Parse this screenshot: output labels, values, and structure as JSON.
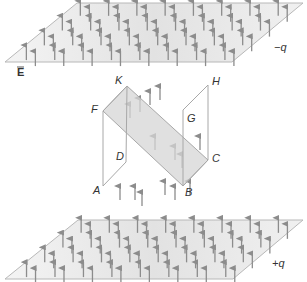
{
  "diagram": {
    "title": "",
    "colors": {
      "plate_fill": "#e8e8e8",
      "plate_edge": "#b8b8b8",
      "arrow": "#8c8c8c",
      "box_edge": "#a8a8a8",
      "diagonal_fill": "#d6d6d6",
      "label": "#333333"
    },
    "field_label": "E",
    "top_plate": {
      "charge_label": "−q",
      "corners": [
        [
          77,
          3
        ],
        [
          303,
          3
        ],
        [
          232,
          62
        ],
        [
          5,
          62
        ]
      ]
    },
    "bottom_plate": {
      "charge_label": "+q",
      "corners": [
        [
          78,
          220
        ],
        [
          303,
          220
        ],
        [
          233,
          279
        ],
        [
          5,
          279
        ]
      ]
    },
    "box": {
      "vertices": {
        "A": [
          103,
          186
        ],
        "B": [
          183,
          186
        ],
        "C": [
          208,
          160
        ],
        "D": [
          126,
          162
        ],
        "F": [
          103,
          111
        ],
        "G": [
          183,
          110
        ],
        "H": [
          208,
          85
        ],
        "K": [
          127,
          86
        ]
      },
      "labels": [
        "K",
        "H",
        "F",
        "G",
        "D",
        "C",
        "A",
        "B"
      ],
      "diagonal_plane": [
        "F",
        "K",
        "C",
        "B"
      ]
    },
    "arrow_direction": "up",
    "arrow_meaning": "uniform electric field lines E pointing from +q plate to −q plate"
  }
}
